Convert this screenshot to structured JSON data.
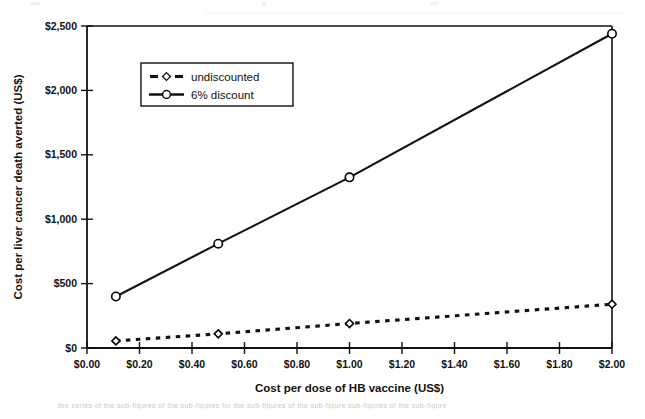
{
  "chart_data": {
    "type": "line",
    "title": "",
    "xlabel": "Cost per dose of HB vaccine (US$)",
    "ylabel": "Cost per liver cancer death averted (US$)",
    "xlim": [
      0.0,
      2.0
    ],
    "ylim": [
      0,
      2500
    ],
    "xticks": [
      0.0,
      0.2,
      0.4,
      0.6,
      0.8,
      1.0,
      1.2,
      1.4,
      1.6,
      1.8,
      2.0
    ],
    "xticklabels": [
      "$0.00",
      "$0.20",
      "$0.40",
      "$0.60",
      "$0.80",
      "$1.00",
      "$1.20",
      "$1.40",
      "$1.60",
      "$1.80",
      "$2.00"
    ],
    "yticks": [
      0,
      500,
      1000,
      1500,
      2000,
      2500
    ],
    "yticklabels": [
      "$0",
      "$500",
      "$1,000",
      "$1,500",
      "$2,000",
      "$2,500"
    ],
    "grid": false,
    "legend_position": "upper-left-inside",
    "series": [
      {
        "name": "undiscounted",
        "marker": "open-diamond",
        "linestyle": "dotted",
        "color": "#000000",
        "x": [
          0.11,
          0.5,
          1.0,
          2.0
        ],
        "y": [
          55,
          110,
          190,
          340
        ]
      },
      {
        "name": "6% discount",
        "marker": "open-circle",
        "linestyle": "solid",
        "color": "#000000",
        "x": [
          0.11,
          0.5,
          1.0,
          2.0
        ],
        "y": [
          400,
          810,
          1325,
          2440
        ]
      }
    ]
  },
  "legend": {
    "entries": [
      {
        "label": "undiscounted"
      },
      {
        "label": "6% discount"
      }
    ]
  },
  "caption": {
    "text": "the series of the sub-figures of the sub-figures for the sub-figures of the sub-figure sub-figures of the sub-figure"
  }
}
